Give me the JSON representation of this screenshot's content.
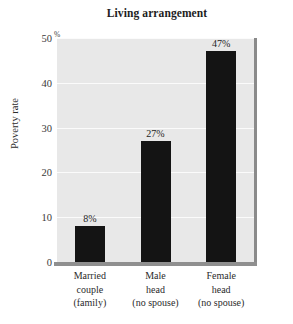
{
  "chart_data": {
    "type": "bar",
    "title": "Living arrangement",
    "xlabel": "",
    "ylabel": "Poverty rate",
    "unit_symbol": "%",
    "ylim": [
      0,
      50
    ],
    "yticks": [
      0,
      10,
      20,
      30,
      40,
      50
    ],
    "ytick_labels": [
      "0",
      "10",
      "20",
      "30",
      "40",
      "50"
    ],
    "grid": true,
    "grid_orientation": "horizontal",
    "legend": false,
    "legend_position": "none",
    "categories": [
      "Married couple (family)",
      "Male head (no spouse)",
      "Female head (no spouse)"
    ],
    "category_label_lines": [
      [
        "Married",
        "couple",
        "(family)"
      ],
      [
        "Male",
        "head",
        "(no spouse)"
      ],
      [
        "Female",
        "head",
        "(no spouse)"
      ]
    ],
    "values": [
      8,
      27,
      47
    ],
    "value_labels": [
      "8%",
      "27%",
      "47%"
    ],
    "colors": {
      "bar": "#141414",
      "plot_background": "#e8e8e8",
      "gridline": "#fbfbfb",
      "axis": "#8f8f8f",
      "text": "#2b2b2b",
      "page_background": "#ffffff"
    }
  }
}
